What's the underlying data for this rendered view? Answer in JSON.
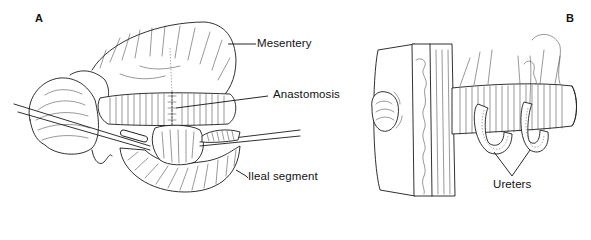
{
  "figure": {
    "panels": [
      {
        "id": "A",
        "letter": "A",
        "labels": {
          "mesentery": "Mesentery",
          "anastomosis": "Anastomosis",
          "ileal_segment": "Ileal segment"
        }
      },
      {
        "id": "B",
        "letter": "B",
        "labels": {
          "ureters": "Ureters"
        }
      }
    ]
  }
}
